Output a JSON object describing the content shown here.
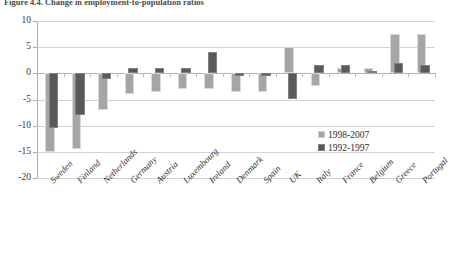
{
  "figure": {
    "caption": "Figure 4.4. Change in employment-to-population ratios"
  },
  "legend": {
    "position": "inside-right",
    "items": [
      {
        "label": "1998-2007",
        "color": "#a6a6a6",
        "series": "recent"
      },
      {
        "label": "1992-1997",
        "color": "#595959",
        "series": "earlier"
      }
    ]
  },
  "chart_data": {
    "type": "bar",
    "title": "Figure 4.4. Change in employment-to-population ratios",
    "xlabel": "",
    "ylabel": "",
    "ylim": [
      -20,
      10
    ],
    "yticks": [
      10,
      5,
      0,
      -5,
      -10,
      -15,
      -20
    ],
    "grid": true,
    "categories": [
      "Sweden",
      "Finland",
      "Netherlands",
      "Germany",
      "Austria",
      "Luxembourg",
      "Ireland",
      "Denmark",
      "Spain",
      "UK",
      "Italy",
      "France",
      "Belgium",
      "Greece",
      "Portugal"
    ],
    "series": [
      {
        "name": "1998-2007",
        "color": "#a6a6a6",
        "values": [
          -15.0,
          -14.5,
          -7.0,
          -4.0,
          -3.5,
          -3.0,
          -3.0,
          -3.5,
          -3.5,
          5.0,
          -2.5,
          1.0,
          1.0,
          7.5,
          7.5
        ]
      },
      {
        "name": "1992-1997",
        "color": "#595959",
        "values": [
          -10.5,
          -8.0,
          -1.0,
          1.0,
          1.0,
          1.0,
          4.0,
          -0.5,
          -0.5,
          -5.0,
          1.5,
          1.5,
          0.5,
          2.0,
          1.5
        ]
      }
    ]
  }
}
